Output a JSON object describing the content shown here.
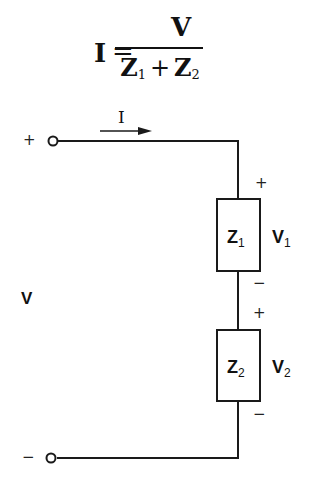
{
  "formula": {
    "lhs": "I",
    "equals": "=",
    "numerator": "V",
    "denominator": {
      "term1": "Z",
      "term1_sub": "1",
      "operator": "+",
      "term2": "Z",
      "term2_sub": "2"
    }
  },
  "circuit": {
    "source_voltage_label": "V",
    "current_label": "I",
    "top_terminal_sign": "+",
    "bottom_terminal_sign": "−",
    "elements": [
      {
        "name": "Z",
        "sub": "1",
        "voltage": "V",
        "voltage_sub": "1",
        "plus": "+",
        "minus": "−"
      },
      {
        "name": "Z",
        "sub": "2",
        "voltage": "V",
        "voltage_sub": "2",
        "plus": "+",
        "minus": "−"
      }
    ],
    "colors": {
      "line": "#1a1a1a",
      "background": "#ffffff"
    }
  }
}
